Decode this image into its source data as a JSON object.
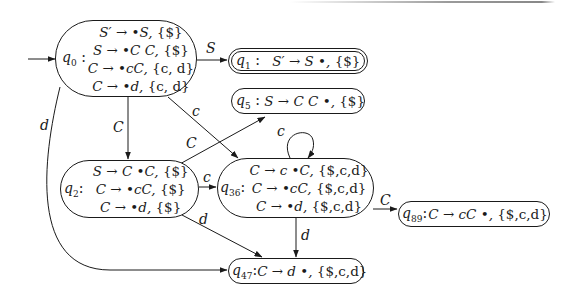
{
  "diagram": {
    "states": [
      {
        "id": "q0",
        "name": "q",
        "sub": "0",
        "separator": " :",
        "items": [
          {
            "rule": "S′ → •S, ",
            "lookahead": "{$}"
          },
          {
            "rule": "S → •C C, ",
            "lookahead": "{$}"
          },
          {
            "rule": "C → •cC, ",
            "lookahead": "{c, d}"
          },
          {
            "rule": "C → •d, ",
            "lookahead": "{c, d}"
          }
        ],
        "start": true
      },
      {
        "id": "q1",
        "name": "q",
        "sub": "1",
        "separator": " :  ",
        "items": [
          {
            "rule": "S′ → S •, ",
            "lookahead": "{$}"
          }
        ],
        "accepting": true
      },
      {
        "id": "q5",
        "name": "q",
        "sub": "5",
        "separator": " : ",
        "items": [
          {
            "rule": "S → C C •, ",
            "lookahead": "{$}"
          }
        ]
      },
      {
        "id": "q2",
        "name": "q",
        "sub": "2",
        "separator": ":",
        "items": [
          {
            "rule": "S → C •C, ",
            "lookahead": "{$}"
          },
          {
            "rule": "C → •cC, ",
            "lookahead": "{$}"
          },
          {
            "rule": "C → •d, ",
            "lookahead": "{$}"
          }
        ]
      },
      {
        "id": "q36",
        "name": "q",
        "sub": "36",
        "separator": ":",
        "items": [
          {
            "rule": "C → c •C, ",
            "lookahead": "{$,c,d}"
          },
          {
            "rule": "C → •cC, ",
            "lookahead": "{$,c,d}"
          },
          {
            "rule": "C → •d, ",
            "lookahead": "{$,c,d}"
          }
        ]
      },
      {
        "id": "q89",
        "name": "q",
        "sub": "89",
        "separator": ":",
        "items": [
          {
            "rule": "C → cC •, ",
            "lookahead": "{$,c,d}"
          }
        ]
      },
      {
        "id": "q47",
        "name": "q",
        "sub": "47",
        "separator": ":",
        "items": [
          {
            "rule": "C → d •, ",
            "lookahead": "{$,c,d}"
          }
        ]
      }
    ],
    "transitions": [
      {
        "from": "q0",
        "to": "q1",
        "label": "S"
      },
      {
        "from": "q0",
        "to": "q2",
        "label": "C"
      },
      {
        "from": "q0",
        "to": "q36",
        "label": "c"
      },
      {
        "from": "q0",
        "to": "q47",
        "label": "d"
      },
      {
        "from": "q2",
        "to": "q5",
        "label": "C"
      },
      {
        "from": "q2",
        "to": "q36",
        "label": "c"
      },
      {
        "from": "q2",
        "to": "q47",
        "label": "d"
      },
      {
        "from": "q36",
        "to": "q36",
        "label": "c"
      },
      {
        "from": "q36",
        "to": "q89",
        "label": "C"
      },
      {
        "from": "q36",
        "to": "q47",
        "label": "d"
      }
    ],
    "colors": {
      "stroke": "#1a1a1a",
      "background": "#ffffff"
    }
  }
}
